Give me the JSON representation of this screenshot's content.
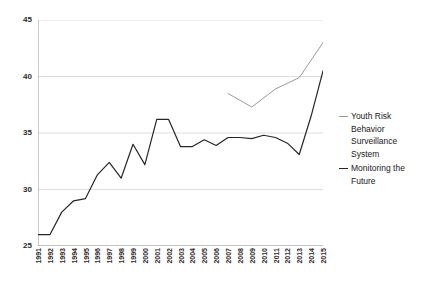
{
  "chart_data": {
    "type": "line",
    "title": "",
    "xlabel": "",
    "ylabel": "",
    "ylim": [
      25,
      45
    ],
    "xlim": [
      1991,
      2015
    ],
    "grid": true,
    "grid_axis": "y",
    "legend_position": "right",
    "y_ticks": [
      25,
      30,
      35,
      40,
      45
    ],
    "categories": [
      "1991",
      "1992",
      "1993",
      "1994",
      "1995",
      "1996",
      "1997",
      "1998",
      "1999",
      "2000",
      "2001",
      "2002",
      "2003",
      "2004",
      "2005",
      "2006",
      "2007",
      "2008",
      "2009",
      "2010",
      "2011",
      "2012",
      "2013",
      "2014",
      "2015"
    ],
    "series": [
      {
        "name": "Monitoring the Future",
        "color": "#262626",
        "x": [
          1991,
          1992,
          1993,
          1994,
          1995,
          1996,
          1997,
          1998,
          1999,
          2000,
          2001,
          2002,
          2003,
          2004,
          2005,
          2006,
          2007,
          2008,
          2009,
          2010,
          2011,
          2012,
          2013,
          2014,
          2015
        ],
        "values": [
          26.0,
          26.0,
          28.0,
          29.0,
          29.2,
          31.3,
          32.4,
          31.0,
          34.0,
          32.2,
          36.2,
          36.2,
          33.8,
          33.8,
          34.4,
          33.9,
          34.6,
          34.6,
          34.5,
          34.8,
          34.6,
          34.1,
          33.1,
          36.5,
          40.5
        ],
        "marker": "none",
        "linewidth": 1.2
      },
      {
        "name": "Youth Risk Behavior Surveillance System",
        "color": "#9a9a9a",
        "x": [
          2007,
          2009,
          2011,
          2013,
          2015
        ],
        "values": [
          38.5,
          37.3,
          38.9,
          39.9,
          43.0
        ],
        "marker": "none",
        "linewidth": 1.0
      }
    ]
  },
  "legend": {
    "entries": [
      {
        "label": "Youth Risk Behavior Surveillance System",
        "color": "#9a9a9a",
        "width": "1px"
      },
      {
        "label": "Monitoring the Future",
        "color": "#262626",
        "width": "1.8px"
      }
    ]
  }
}
